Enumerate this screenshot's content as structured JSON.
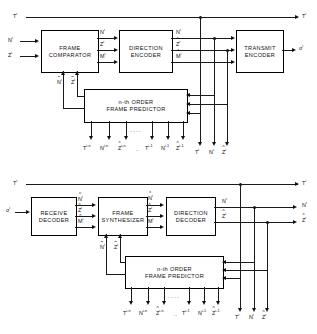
{
  "figure": {
    "type": "block-diagram"
  },
  "encoder": {
    "blocks": {
      "frame_comparator": {
        "line1": "FRAME",
        "line2": "COMPARATOR"
      },
      "direction_encoder": {
        "line1": "DIRECTION",
        "line2": "ENCODER"
      },
      "transmit_encoder": {
        "line1": "TRANSMIT",
        "line2": "ENCODER"
      },
      "frame_predictor": {
        "line1": "n-th ORDER",
        "line2": "FRAME  PREDICTOR"
      }
    },
    "inputs": {
      "t": "T",
      "t_sup": "i",
      "n": "N",
      "n_sup": "i",
      "z": "Z",
      "z_sup": "i"
    },
    "comparator_outputs": [
      {
        "base": "N",
        "sup": "i",
        "accent": "none"
      },
      {
        "base": "Z",
        "sup": "i",
        "accent": "tilde"
      },
      {
        "base": "M",
        "sup": "i",
        "accent": "none"
      }
    ],
    "direction_encoder_outputs": [
      {
        "base": "N",
        "sup": "i",
        "accent": "none"
      },
      {
        "base": "Z",
        "sup": "i",
        "accent": "hat"
      },
      {
        "base": "M",
        "sup": "i",
        "accent": "hat"
      }
    ],
    "feedback": [
      {
        "base": "N",
        "sup": "i",
        "accent": "tilde"
      },
      {
        "base": "Z",
        "sup": "i",
        "accent": "tilde"
      }
    ],
    "predictor_taps": [
      {
        "base": "T",
        "sup": "i-n",
        "accent": "none"
      },
      {
        "base": "N",
        "sup": "i-n",
        "accent": "none"
      },
      {
        "base": "Z",
        "sup": "i-n",
        "accent": "hat"
      },
      {
        "base": "T",
        "sup": "i-1",
        "accent": "none"
      },
      {
        "base": "N",
        "sup": "i-1",
        "accent": "none"
      },
      {
        "base": "Z",
        "sup": "i-1",
        "accent": "hat"
      }
    ],
    "bus_labels": [
      {
        "base": "T",
        "sup": "i",
        "accent": "none"
      },
      {
        "base": "N",
        "sup": "i",
        "accent": "none"
      },
      {
        "base": "Z",
        "sup": "i",
        "accent": "hat"
      }
    ],
    "top_output": {
      "base": "T",
      "sup": "i",
      "accent": "none"
    },
    "transmit_output": {
      "base": "σ",
      "sup": "i",
      "accent": "none"
    },
    "ellipsis": "····",
    "tap_gap": ".."
  },
  "decoder": {
    "blocks": {
      "receive_decoder": {
        "line1": "RECEIVE",
        "line2": "DECODER"
      },
      "frame_synthesizer": {
        "line1": "FRAME",
        "line2": "SYNTHESIZER"
      },
      "direction_decoder": {
        "line1": "DIRECTION",
        "line2": "DECODER"
      },
      "frame_predictor": {
        "line1": "n-th ORDER",
        "line2": "FRAME  PREDICTOR"
      }
    },
    "input": {
      "base": "σ",
      "sup": "i",
      "accent": "none"
    },
    "top_input": {
      "base": "T",
      "sup": "i",
      "accent": "none"
    },
    "receive_outputs": [
      {
        "base": "N",
        "sup": "i",
        "accent": "hat"
      },
      {
        "base": "Z",
        "sup": "i",
        "accent": "hat"
      },
      {
        "base": "M",
        "sup": "i",
        "accent": "hat"
      }
    ],
    "synthesizer_outputs": [
      {
        "base": "N",
        "sup": "i",
        "accent": "hat"
      },
      {
        "base": "Z",
        "sup": "i",
        "accent": "hat"
      },
      {
        "base": "M",
        "sup": "i",
        "accent": "none"
      }
    ],
    "direction_decoder_outputs": [
      {
        "base": "N",
        "sup": "i",
        "accent": "none"
      },
      {
        "base": "Z",
        "sup": "i",
        "accent": "hat"
      }
    ],
    "feedback": [
      {
        "base": "N",
        "sup": "i",
        "accent": "tilde"
      },
      {
        "base": "Z",
        "sup": "i",
        "accent": "tilde"
      }
    ],
    "predictor_taps": [
      {
        "base": "T",
        "sup": "i-n",
        "accent": "none"
      },
      {
        "base": "N",
        "sup": "i-n",
        "accent": "none"
      },
      {
        "base": "Z",
        "sup": "i-n",
        "accent": "hat"
      },
      {
        "base": "T",
        "sup": "i-1",
        "accent": "none"
      },
      {
        "base": "N",
        "sup": "i-1",
        "accent": "none"
      },
      {
        "base": "Z",
        "sup": "i-1",
        "accent": "hat"
      }
    ],
    "bus_labels": [
      {
        "base": "T",
        "sup": "i",
        "accent": "none"
      },
      {
        "base": "N",
        "sup": "i",
        "accent": "none"
      },
      {
        "base": "Z",
        "sup": "i",
        "accent": "hat"
      }
    ],
    "outputs": [
      {
        "base": "T",
        "sup": "i",
        "accent": "none"
      },
      {
        "base": "N",
        "sup": "i",
        "accent": "none"
      },
      {
        "base": "Z",
        "sup": "i",
        "accent": "hat"
      }
    ],
    "ellipsis": "····",
    "tap_gap": ".."
  }
}
